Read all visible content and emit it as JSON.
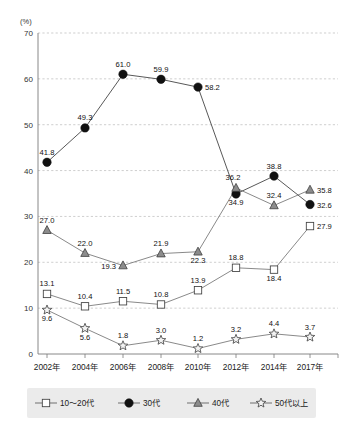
{
  "chart_data": {
    "type": "line",
    "title": "",
    "subtitle": "",
    "xlabel": "",
    "ylabel": "",
    "unit_label": "(%)",
    "ylim": [
      0,
      70
    ],
    "ytick_values": [
      0,
      10,
      20,
      30,
      40,
      50,
      60,
      70
    ],
    "ytick_labels": [
      "0",
      "10",
      "20",
      "30",
      "40",
      "50",
      "60",
      "70"
    ],
    "grid": true,
    "legend_position": "bottom",
    "categories": [
      "2002年",
      "2004年",
      "2006年",
      "2008年",
      "2010年",
      "2012年",
      "2014年",
      "2017年"
    ],
    "series": [
      {
        "name": "10〜20代",
        "marker": "square-open",
        "line": "solid-thin",
        "values": [
          13.1,
          10.4,
          11.5,
          10.8,
          13.9,
          18.8,
          18.4,
          27.9
        ],
        "label_positions": [
          "above",
          "above",
          "above",
          "above",
          "above",
          "above",
          "below",
          "right"
        ]
      },
      {
        "name": "30代",
        "marker": "circle-filled",
        "line": "solid",
        "values": [
          41.8,
          49.3,
          61.0,
          59.9,
          58.2,
          34.9,
          38.8,
          32.6
        ],
        "label_positions": [
          "above",
          "above",
          "above",
          "above",
          "right",
          "below",
          "above",
          "right"
        ]
      },
      {
        "name": "40代",
        "marker": "triangle-gray",
        "line": "solid-thin",
        "values": [
          27.0,
          22.0,
          19.3,
          21.9,
          22.3,
          36.2,
          32.4,
          35.8
        ],
        "label_positions": [
          "above",
          "above",
          "left",
          "above",
          "below",
          "above-left",
          "above",
          "right"
        ]
      },
      {
        "name": "50代以上",
        "marker": "star-open",
        "line": "solid-thin",
        "values": [
          9.6,
          5.6,
          1.8,
          3.0,
          1.2,
          3.2,
          4.4,
          3.7
        ],
        "label_positions": [
          "below",
          "below",
          "above",
          "above",
          "above",
          "above",
          "above",
          "above"
        ]
      }
    ],
    "colors": {
      "grid": "#b9b9b9",
      "axis": "#7a7a7a",
      "marker_circle": "#111111",
      "marker_triangle": "#8c8c8c",
      "marker_square": "#ffffff",
      "marker_star": "#f2f2f2",
      "legend_background": "#ebebeb",
      "text": "#1a1a1a"
    }
  },
  "legend": {
    "items": [
      {
        "label": "10〜20代",
        "marker": "square-open"
      },
      {
        "label": "30代",
        "marker": "circle-filled"
      },
      {
        "label": "40代",
        "marker": "triangle-gray"
      },
      {
        "label": "50代以上",
        "marker": "star-open"
      }
    ]
  }
}
